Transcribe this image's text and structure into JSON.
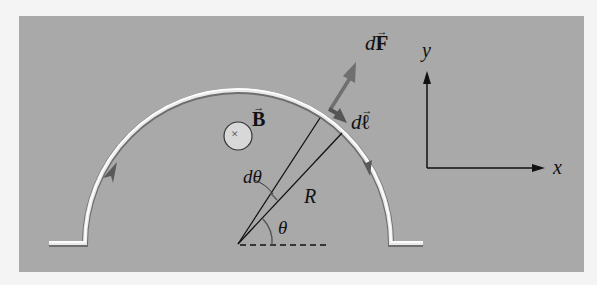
{
  "figure": {
    "colors": {
      "background": "#f4f4f4",
      "panel": "#a9a9a9",
      "wire_highlight": "#ffffff",
      "wire_shadow": "#6e6e6e",
      "force_arrow": "#6f6f6f",
      "line": "#111111"
    },
    "labels": {
      "force": {
        "prefix": "d",
        "symbol": "F",
        "vector_mark": "→"
      },
      "length_element": {
        "prefix": "d",
        "symbol": "ℓ",
        "vector_mark": "→"
      },
      "field": {
        "symbol": "B",
        "vector_mark": "→"
      },
      "field_direction_symbol": "×",
      "d_theta": "dθ",
      "radius": "R",
      "theta": "θ",
      "axis_x": "x",
      "axis_y": "y"
    },
    "geometry": {
      "arc_center": [
        238,
        244
      ],
      "arc_radius": 153,
      "current_direction": "clockwise along semicircle (left to right over the top)",
      "field_direction": "into page"
    }
  }
}
